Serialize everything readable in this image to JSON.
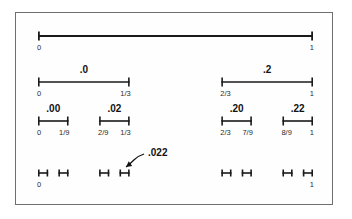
{
  "figure": {
    "border_color": "#6f6f72",
    "background_color": "#fefefe",
    "ink_color": "#1a1a1a"
  },
  "geometry": {
    "axis_left": 38,
    "axis_right": 313,
    "row_y": [
      36,
      82,
      121,
      173
    ],
    "tick_height": 9,
    "tick_height_small": 7,
    "line_width_row": [
      1.8,
      1.6,
      1.6,
      1.6
    ]
  },
  "chart_data": {
    "type": "line",
    "xlabel": "",
    "ylabel": "",
    "xlim": [
      0,
      1
    ],
    "grid": false,
    "legend": "none",
    "rows": [
      {
        "level": 0,
        "segments": [
          {
            "start": 0,
            "end": 1,
            "code": ""
          }
        ],
        "tick_labels": [
          {
            "value": 0,
            "text": "0",
            "align": "start"
          },
          {
            "value": 1,
            "text": "1",
            "align": "end"
          }
        ]
      },
      {
        "level": 1,
        "segments": [
          {
            "start": 0,
            "end": 0.3333333,
            "code": ".0"
          },
          {
            "start": 0.6666667,
            "end": 1,
            "code": ".2"
          }
        ],
        "tick_labels": [
          {
            "value": 0,
            "text": "0",
            "align": "start"
          },
          {
            "value": 0.3333333,
            "text": "1/3",
            "align": "end"
          },
          {
            "value": 0.6666667,
            "text": "2/3",
            "align": "start"
          },
          {
            "value": 1,
            "text": "1",
            "align": "end"
          }
        ]
      },
      {
        "level": 2,
        "segments": [
          {
            "start": 0,
            "end": 0.1111111,
            "code": ".00"
          },
          {
            "start": 0.2222222,
            "end": 0.3333333,
            "code": ".02"
          },
          {
            "start": 0.6666667,
            "end": 0.7777778,
            "code": ".20"
          },
          {
            "start": 0.8888889,
            "end": 1,
            "code": ".22"
          }
        ],
        "tick_labels": [
          {
            "value": 0,
            "text": "0",
            "align": "start"
          },
          {
            "value": 0.1111111,
            "text": "1/9",
            "align": "end"
          },
          {
            "value": 0.2222222,
            "text": "2/9",
            "align": "start"
          },
          {
            "value": 0.3333333,
            "text": "1/3",
            "align": "end"
          },
          {
            "value": 0.6666667,
            "text": "2/3",
            "align": "start"
          },
          {
            "value": 0.7777778,
            "text": "7/9",
            "align": "end"
          },
          {
            "value": 0.8888889,
            "text": "8/9",
            "align": "start"
          },
          {
            "value": 1,
            "text": "1",
            "align": "end"
          }
        ]
      },
      {
        "level": 3,
        "segments": [
          {
            "start": 0,
            "end": 0.037037,
            "code": ""
          },
          {
            "start": 0.0740741,
            "end": 0.1111111,
            "code": ""
          },
          {
            "start": 0.2222222,
            "end": 0.2592593,
            "code": ""
          },
          {
            "start": 0.2962963,
            "end": 0.3333333,
            "code": ""
          },
          {
            "start": 0.6666667,
            "end": 0.7037037,
            "code": ""
          },
          {
            "start": 0.7407407,
            "end": 0.7777778,
            "code": ""
          },
          {
            "start": 0.8888889,
            "end": 0.9259259,
            "code": ""
          },
          {
            "start": 0.962963,
            "end": 1,
            "code": ""
          }
        ],
        "tick_labels": [
          {
            "value": 0,
            "text": "0",
            "align": "start"
          },
          {
            "value": 1,
            "text": "1",
            "align": "end"
          }
        ]
      }
    ],
    "annotations": [
      {
        "text": ".022",
        "points_to_segment_index": 3,
        "points_to_row": 3,
        "label_x": 148,
        "label_y": 156
      }
    ]
  }
}
